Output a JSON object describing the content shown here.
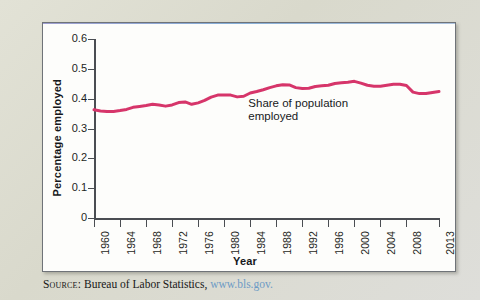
{
  "figure": {
    "source_prefix": "Source:",
    "source_text": "Bureau of Labor Statistics,",
    "source_url": "www.bls.gov.",
    "panel_background": "#fdfdfb",
    "page_background": "#dcdcd0",
    "line_color": "#d6356a"
  },
  "chart_data": {
    "type": "line",
    "title": "",
    "xlabel": "Year",
    "ylabel": "Percentage employed",
    "ylim": [
      0,
      0.6
    ],
    "xlim": [
      1960,
      2013
    ],
    "grid": false,
    "legend": "none",
    "annotations": [
      {
        "text": "Share of population\nemployed",
        "x": 1996,
        "y": 0.425
      }
    ],
    "ytick_labels": [
      "0",
      "0.1",
      "0.2",
      "0.3",
      "0.4",
      "0.5",
      "0.6"
    ],
    "ytick_values": [
      0,
      0.1,
      0.2,
      0.3,
      0.4,
      0.5,
      0.6
    ],
    "xtick_labels": [
      "1960",
      "1964",
      "1968",
      "1972",
      "1976",
      "1980",
      "1984",
      "1988",
      "1992",
      "1996",
      "2000",
      "2004",
      "2008",
      "2013"
    ],
    "xtick_values": [
      1960,
      1964,
      1968,
      1972,
      1976,
      1980,
      1984,
      1988,
      1992,
      1996,
      2000,
      2004,
      2008,
      2013
    ],
    "series": [
      {
        "name": "Share of population employed",
        "color": "#d6356a",
        "x": [
          1960,
          1961,
          1962,
          1963,
          1964,
          1965,
          1966,
          1967,
          1968,
          1969,
          1970,
          1971,
          1972,
          1973,
          1974,
          1975,
          1976,
          1977,
          1978,
          1979,
          1980,
          1981,
          1982,
          1983,
          1984,
          1985,
          1986,
          1987,
          1988,
          1989,
          1990,
          1991,
          1992,
          1993,
          1994,
          1995,
          1996,
          1997,
          1998,
          1999,
          2000,
          2001,
          2002,
          2003,
          2004,
          2005,
          2006,
          2007,
          2008,
          2009,
          2010,
          2011,
          2012,
          2013
        ],
        "y": [
          0.363,
          0.359,
          0.357,
          0.357,
          0.36,
          0.364,
          0.371,
          0.374,
          0.377,
          0.381,
          0.379,
          0.375,
          0.379,
          0.387,
          0.389,
          0.381,
          0.386,
          0.394,
          0.405,
          0.412,
          0.412,
          0.412,
          0.406,
          0.408,
          0.419,
          0.424,
          0.43,
          0.437,
          0.443,
          0.447,
          0.446,
          0.437,
          0.434,
          0.435,
          0.441,
          0.443,
          0.445,
          0.451,
          0.453,
          0.455,
          0.458,
          0.452,
          0.445,
          0.442,
          0.442,
          0.445,
          0.448,
          0.448,
          0.444,
          0.422,
          0.417,
          0.417,
          0.421,
          0.424
        ]
      }
    ]
  }
}
